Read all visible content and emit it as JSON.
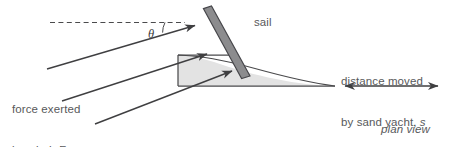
{
  "diagram": {
    "view_label": "plan view",
    "colors": {
      "line": "#3f3f41",
      "text": "#58595b",
      "hull_fill": "#e3e3e3",
      "hull_stroke": "#4a4a4c",
      "sail_fill": "#8c8c8e",
      "sail_stroke": "#46464a",
      "background": "#ffffff"
    },
    "labels": {
      "sail": "sail",
      "angle_symbol": "θ",
      "force_line1": "force exerted",
      "force_line2_prefix": "by wind, ",
      "force_symbol": "F",
      "distance_line1": "distance moved",
      "distance_line2_prefix": "by sand yacht, ",
      "distance_symbol": "s",
      "plan_view": "plan view"
    },
    "elements": {
      "dashed_reference_line": "horizontal dashed line",
      "wind_force_arrows": 3,
      "distance_arrow": "double-headed arrow",
      "sail_bar": "tilted thick bar",
      "hull": "light grey yacht body with rectangular cabin"
    }
  }
}
